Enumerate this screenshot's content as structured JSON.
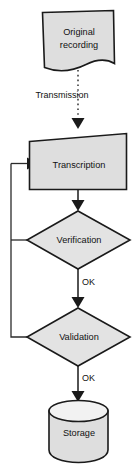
{
  "diagram": {
    "orientation": "top-to-bottom",
    "background_color": "#ffffff",
    "node_fill_color": "#dedede",
    "node_stroke_color": "#1a1a1a",
    "text_color": "#111111",
    "nodes": [
      {
        "id": "original-recording",
        "label_line1": "Original",
        "label_line2": "recording",
        "shape": "document",
        "x": 78,
        "y": 40
      },
      {
        "id": "transcription",
        "label": "Transcription",
        "shape": "process-rectangle",
        "x": 78,
        "y": 165
      },
      {
        "id": "verification",
        "label": "Verification",
        "shape": "decision-diamond",
        "x": 78,
        "y": 240
      },
      {
        "id": "validation",
        "label": "Validation",
        "shape": "decision-diamond",
        "x": 78,
        "y": 337
      },
      {
        "id": "storage",
        "label": "Storage",
        "shape": "cylinder-database",
        "x": 78,
        "y": 432
      }
    ],
    "edges": [
      {
        "id": "edge-transmission",
        "from": "original-recording",
        "to": "transcription",
        "label": "Transmission",
        "style": "dotted",
        "arrow": true
      },
      {
        "id": "edge-transcription-verification",
        "from": "transcription",
        "to": "verification",
        "label": "",
        "style": "solid",
        "arrow": true
      },
      {
        "id": "edge-verification-validation",
        "from": "verification",
        "to": "validation",
        "label": "OK",
        "style": "solid",
        "arrow": true
      },
      {
        "id": "edge-validation-storage",
        "from": "validation",
        "to": "storage",
        "label": "OK",
        "style": "solid",
        "arrow": true
      },
      {
        "id": "edge-verification-feedback",
        "from": "verification",
        "to": "transcription",
        "label": "",
        "style": "solid",
        "arrow": true
      },
      {
        "id": "edge-validation-feedback",
        "from": "validation",
        "to": "transcription",
        "label": "",
        "style": "solid",
        "arrow": true
      }
    ]
  }
}
